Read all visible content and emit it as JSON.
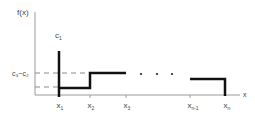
{
  "diagram": {
    "axes": {
      "y_label": "f(x)",
      "x_label": "x"
    },
    "y_labels": [
      {
        "id": "c1",
        "base": "c",
        "sub": "1"
      },
      {
        "id": "c3_minus_c2",
        "text": "c₃−c₂"
      }
    ],
    "x_ticks": [
      {
        "base": "x",
        "sub": "1",
        "x": 59
      },
      {
        "base": "x",
        "sub": "2",
        "x": 90
      },
      {
        "base": "x",
        "sub": "3",
        "x": 126
      },
      {
        "base": "x",
        "sub": "n-1",
        "x": 190
      },
      {
        "base": "x",
        "sub": "n",
        "x": 225
      }
    ],
    "ellipsis": "· · ·",
    "colors": {
      "axis": "#9a9a9a",
      "step": "#111111",
      "dash": "#8a8a8a",
      "text": "#444444"
    }
  }
}
